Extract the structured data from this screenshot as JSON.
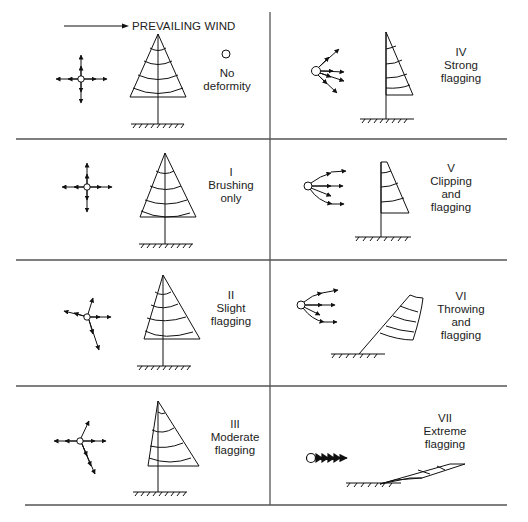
{
  "header": {
    "wind_label": "PREVAILING WIND",
    "wind_arrow_icon": "arrow-right-icon"
  },
  "grid": {
    "line_color": "#555555",
    "rows_y": [
      139,
      260,
      386,
      505
    ],
    "column_x": 270,
    "left_x": 16,
    "right_x": 507
  },
  "panels": [
    {
      "id": "none",
      "numeral": "",
      "lines": [
        "No",
        "deformity"
      ],
      "column": "left",
      "row": 0,
      "marker_icon": "small-circle-icon"
    },
    {
      "id": "I",
      "numeral": "I",
      "lines": [
        "Brushing",
        "only"
      ],
      "column": "left",
      "row": 1
    },
    {
      "id": "II",
      "numeral": "II",
      "lines": [
        "Slight",
        "flagging"
      ],
      "column": "left",
      "row": 2
    },
    {
      "id": "III",
      "numeral": "III",
      "lines": [
        "Moderate",
        "flagging"
      ],
      "column": "left",
      "row": 3
    },
    {
      "id": "IV",
      "numeral": "IV",
      "lines": [
        "Strong",
        "flagging"
      ],
      "column": "right",
      "row": 0
    },
    {
      "id": "V",
      "numeral": "V",
      "lines": [
        "Clipping",
        "and",
        "flagging"
      ],
      "column": "right",
      "row": 1
    },
    {
      "id": "VI",
      "numeral": "VI",
      "lines": [
        "Throwing",
        "and",
        "flagging"
      ],
      "column": "right",
      "row": 2
    },
    {
      "id": "VII",
      "numeral": "VII",
      "lines": [
        "Extreme",
        "flagging"
      ],
      "column": "right",
      "row": 3
    }
  ]
}
